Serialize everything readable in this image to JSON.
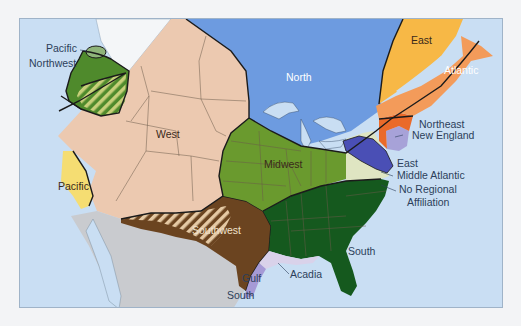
{
  "map": {
    "title": "",
    "colors": {
      "ocean": "#c9def3",
      "north": "#6d9be0",
      "west": "#ecc9b0",
      "pacific_northwest": "#4f8a2c",
      "pacific_northwest_hatch": "#c7cf7a",
      "pacific": "#f5dd72",
      "midwest": "#6a9a2e",
      "south": "#15591e",
      "southwest": "#6b4420",
      "southwest_hatch": "#e5c9a4",
      "east": "#f7b846",
      "atlantic": "#f39b5a",
      "northeast": "#ea6a2a",
      "new_england": "#a7a2d8",
      "middle_atlantic": "#4a4fb5",
      "no_regional_affiliation": "#dfe5c2",
      "acadia": "#d9d2ea",
      "gulf_south": "#a69ad6",
      "mexico": "#c9cbcf"
    },
    "regions": [
      {
        "id": "pacific-northwest",
        "label_lines": [
          "Pacific",
          "Northwest"
        ]
      },
      {
        "id": "west",
        "label_lines": [
          "West"
        ]
      },
      {
        "id": "pacific",
        "label_lines": [
          "Pacific"
        ]
      },
      {
        "id": "north",
        "label_lines": [
          "North"
        ]
      },
      {
        "id": "east",
        "label_lines": [
          "East"
        ]
      },
      {
        "id": "atlantic",
        "label_lines": [
          "Atlantic"
        ]
      },
      {
        "id": "northeast",
        "label_lines": [
          "Northeast"
        ]
      },
      {
        "id": "new-england",
        "label_lines": [
          "New England"
        ]
      },
      {
        "id": "midwest",
        "label_lines": [
          "Midwest"
        ]
      },
      {
        "id": "east-middle-atlantic",
        "label_lines": [
          "East",
          "Middle Atlantic"
        ]
      },
      {
        "id": "no-regional-affiliation",
        "label_lines": [
          "No Regional",
          "Affiliation"
        ]
      },
      {
        "id": "southwest",
        "label_lines": [
          "Southwest"
        ]
      },
      {
        "id": "south",
        "label_lines": [
          "South"
        ]
      },
      {
        "id": "acadia",
        "label_lines": [
          "Acadia"
        ]
      },
      {
        "id": "gulf-south",
        "label_lines": [
          "Gulf",
          "South"
        ]
      }
    ]
  }
}
